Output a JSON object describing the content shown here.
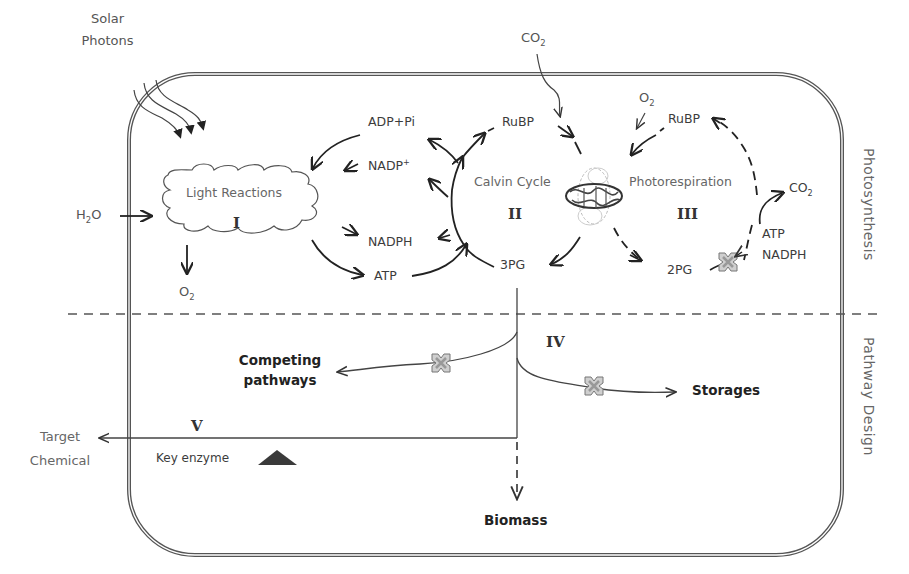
{
  "diagram": {
    "sections": {
      "top": "Photosynthesis",
      "bottom": "Pathway Design"
    },
    "external_inputs": {
      "solar": [
        "Solar",
        "Photons"
      ],
      "h2o": "H",
      "h2o_sub": "2",
      "h2o_tail": "O",
      "o2_out": "O",
      "o2_out_sub": "2",
      "co2_in": "CO",
      "co2_in_sub": "2"
    },
    "module_I": {
      "name": "Light Reactions",
      "numeral": "I"
    },
    "cofactors": {
      "adp": "ADP+Pi",
      "nadp": "NADP",
      "nadp_sup": "+",
      "nadph": "NADPH",
      "atp": "ATP"
    },
    "module_II": {
      "name": "Calvin Cycle",
      "numeral": "II",
      "rubp": "RuBP",
      "pg3": "3PG"
    },
    "module_III": {
      "name": "Photorespiration",
      "numeral": "III",
      "o2": "O",
      "o2_sub": "2",
      "rubp": "RuBP",
      "pg2": "2PG",
      "co2": "CO",
      "co2_sub": "2",
      "atp": "ATP",
      "nadph": "NADPH"
    },
    "enzyme": "rubisco-structure-icon",
    "module_IV": {
      "numeral": "IV",
      "competing": [
        "Competing",
        "pathways"
      ],
      "storages": "Storages"
    },
    "module_V": {
      "numeral": "V",
      "target": [
        "Target",
        "Chemical"
      ],
      "key_enzyme": "Key enzyme"
    },
    "biomass": "Biomass",
    "icons": {
      "block": "blocked-pathway-x-icon",
      "key_enzyme": "key-enzyme-triangle-icon"
    },
    "colors": {
      "line": "#333333",
      "border": "#555555",
      "block_fill": "#c8c8c8",
      "triangle": "#3a3a3a",
      "text": "#444444"
    }
  }
}
